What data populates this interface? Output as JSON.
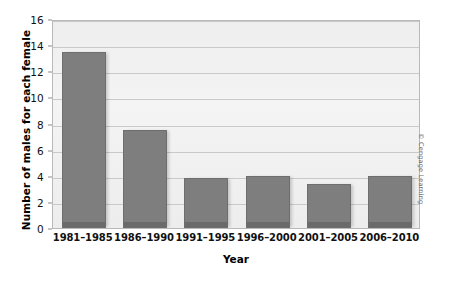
{
  "chart_data": {
    "type": "bar",
    "title": "",
    "xlabel": "Year",
    "ylabel": "Number of males for each female",
    "categories": [
      "1981–1985",
      "1986–1990",
      "1991–1995",
      "1996–2000",
      "2001–2005",
      "2006–2010"
    ],
    "values": [
      13.5,
      7.5,
      3.8,
      4.0,
      3.4,
      4.0
    ],
    "ylim": [
      0,
      16
    ],
    "ytick_values": [
      0,
      2,
      4,
      6,
      8,
      10,
      12,
      14,
      16
    ],
    "ytick_labels": [
      "0",
      "2",
      "4",
      "6",
      "8",
      "10",
      "12",
      "14",
      "16"
    ],
    "grid": true,
    "grid_axis": "y",
    "legend": false,
    "legend_position": "none",
    "bar_color": "#7e7e7e",
    "plot_background": "#f2f2f2",
    "gridline_color": "#c9c9c9",
    "axis_color": "#b9b9b9"
  },
  "credit": {
    "text": "© Cengage Learning"
  }
}
